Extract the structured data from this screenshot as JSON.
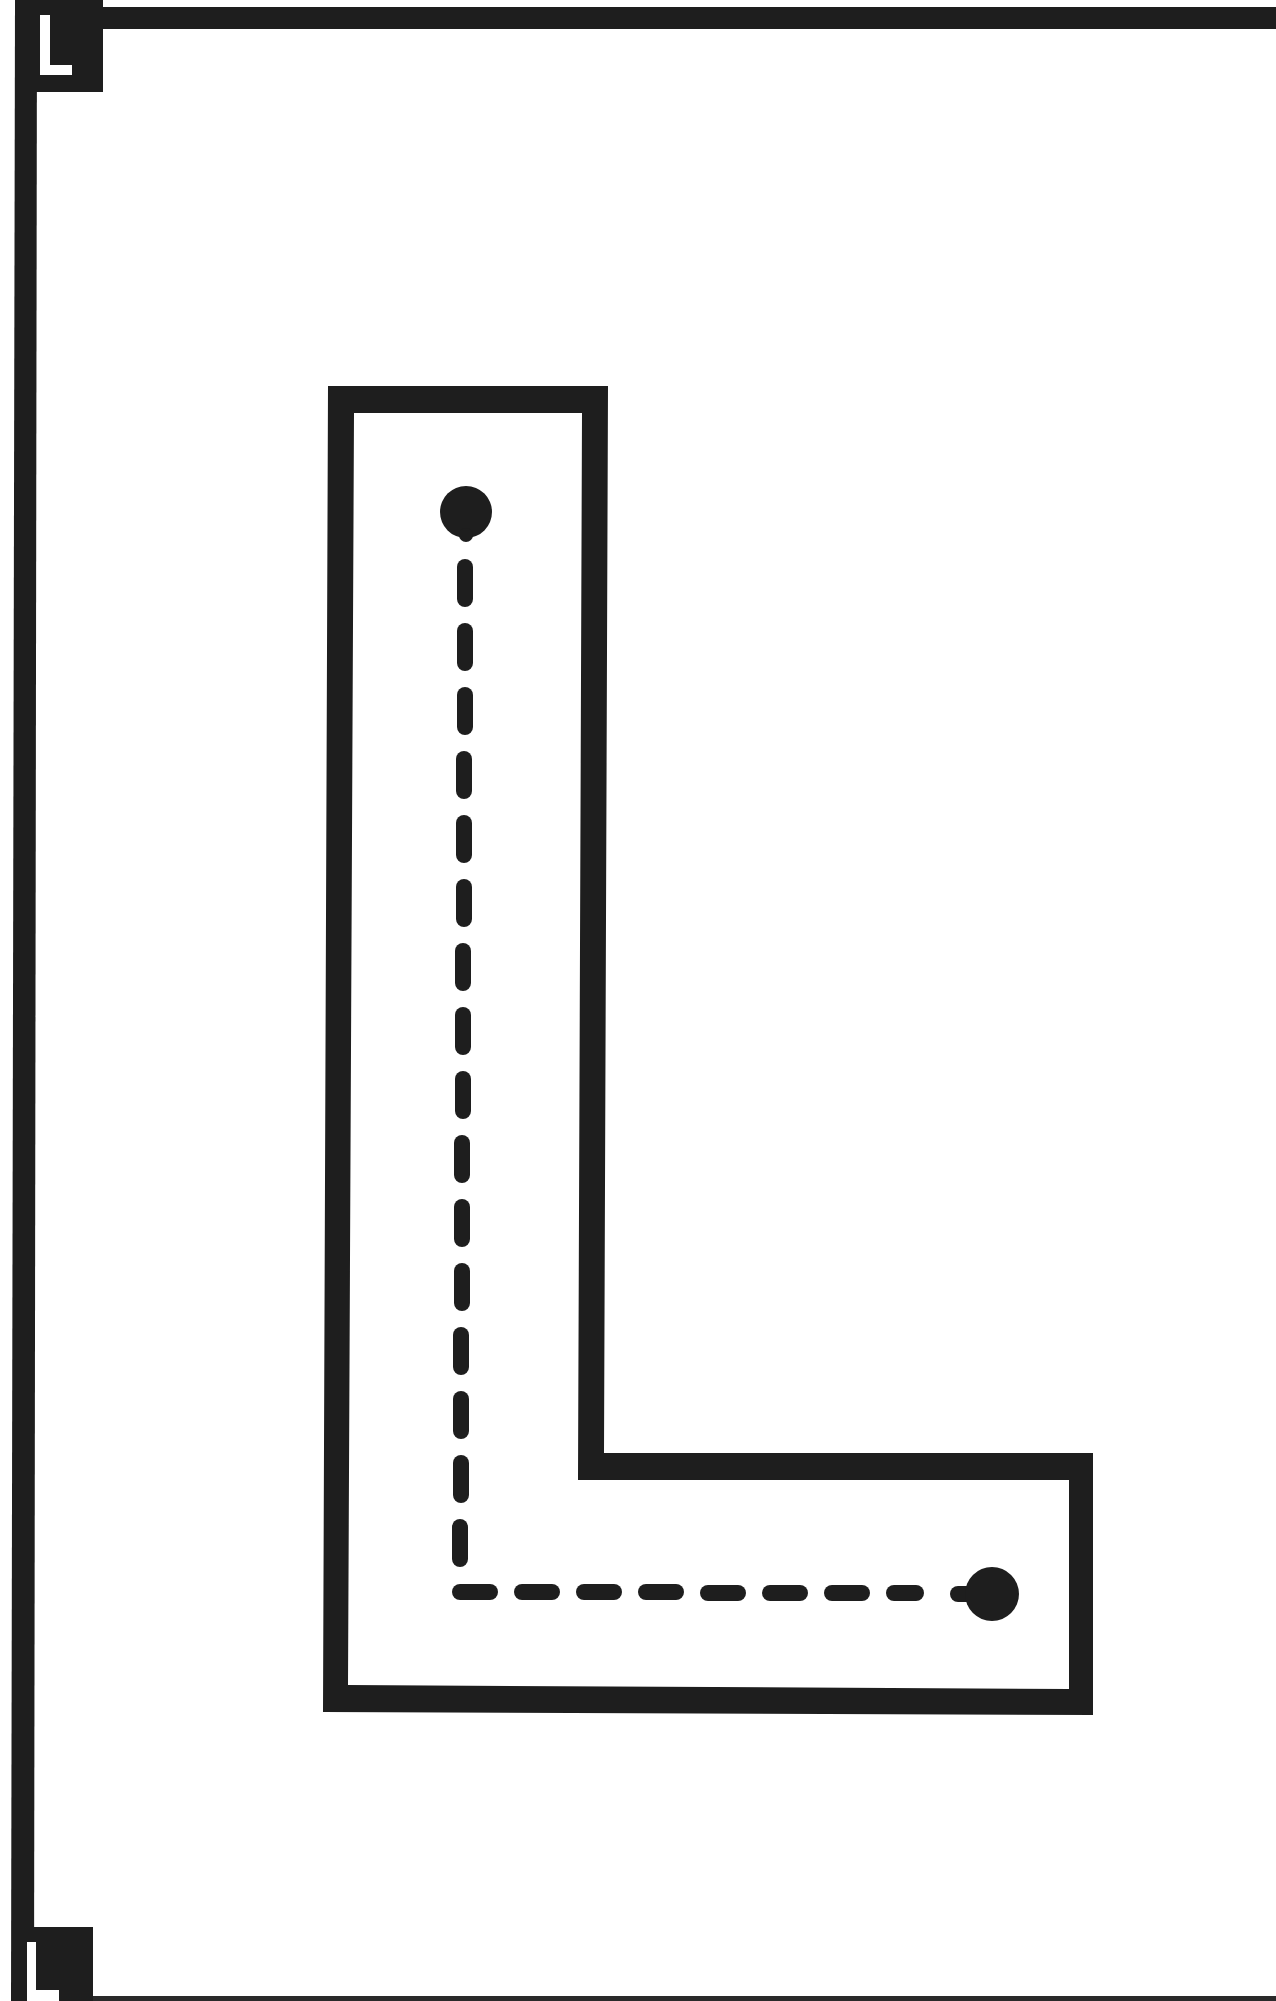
{
  "worksheet": {
    "letter": "L",
    "corner_label_top": "L",
    "corner_label_bottom": "L",
    "instruction_mode": "trace-dashed-path",
    "start_point": "top-dot",
    "end_point": "bottom-right-dot"
  },
  "colors": {
    "ink": "#1e1e1e",
    "paper": "#ffffff"
  }
}
